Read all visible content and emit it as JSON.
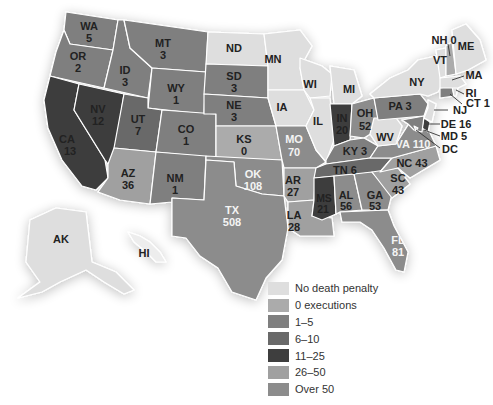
{
  "map": {
    "subject": "Executions by state",
    "states": [
      {
        "abbr": "WA",
        "value": "5",
        "category": "1-5"
      },
      {
        "abbr": "OR",
        "value": "2",
        "category": "1-5"
      },
      {
        "abbr": "CA",
        "value": "13",
        "category": "11-25"
      },
      {
        "abbr": "NV",
        "value": "12",
        "category": "11-25"
      },
      {
        "abbr": "ID",
        "value": "3",
        "category": "1-5"
      },
      {
        "abbr": "MT",
        "value": "3",
        "category": "1-5"
      },
      {
        "abbr": "WY",
        "value": "1",
        "category": "1-5"
      },
      {
        "abbr": "UT",
        "value": "7",
        "category": "6-10"
      },
      {
        "abbr": "AZ",
        "value": "36",
        "category": "26-50"
      },
      {
        "abbr": "CO",
        "value": "1",
        "category": "1-5"
      },
      {
        "abbr": "NM",
        "value": "1",
        "category": "1-5"
      },
      {
        "abbr": "ND",
        "value": "",
        "category": "No death penalty"
      },
      {
        "abbr": "SD",
        "value": "3",
        "category": "1-5"
      },
      {
        "abbr": "NE",
        "value": "3",
        "category": "1-5"
      },
      {
        "abbr": "KS",
        "value": "0",
        "category": "0 executions"
      },
      {
        "abbr": "OK",
        "value": "108",
        "category": "Over 50"
      },
      {
        "abbr": "TX",
        "value": "508",
        "category": "Over 50"
      },
      {
        "abbr": "MN",
        "value": "",
        "category": "No death penalty"
      },
      {
        "abbr": "IA",
        "value": "",
        "category": "No death penalty"
      },
      {
        "abbr": "MO",
        "value": "70",
        "category": "Over 50"
      },
      {
        "abbr": "AR",
        "value": "27",
        "category": "26-50"
      },
      {
        "abbr": "LA",
        "value": "28",
        "category": "26-50"
      },
      {
        "abbr": "WI",
        "value": "",
        "category": "No death penalty"
      },
      {
        "abbr": "IL",
        "value": "",
        "category": "No death penalty"
      },
      {
        "abbr": "MI",
        "value": "",
        "category": "No death penalty"
      },
      {
        "abbr": "IN",
        "value": "20",
        "category": "11-25"
      },
      {
        "abbr": "OH",
        "value": "52",
        "category": "Over 50"
      },
      {
        "abbr": "KY",
        "value": "3",
        "category": "1-5"
      },
      {
        "abbr": "TN",
        "value": "6",
        "category": "6-10"
      },
      {
        "abbr": "MS",
        "value": "21",
        "category": "11-25"
      },
      {
        "abbr": "AL",
        "value": "56",
        "category": "Over 50"
      },
      {
        "abbr": "GA",
        "value": "53",
        "category": "Over 50"
      },
      {
        "abbr": "FL",
        "value": "81",
        "category": "Over 50"
      },
      {
        "abbr": "SC",
        "value": "43",
        "category": "26-50"
      },
      {
        "abbr": "NC",
        "value": "43",
        "category": "26-50"
      },
      {
        "abbr": "VA",
        "value": "110",
        "category": "Over 50"
      },
      {
        "abbr": "WV",
        "value": "",
        "category": "No death penalty"
      },
      {
        "abbr": "PA",
        "value": "3",
        "category": "1-5"
      },
      {
        "abbr": "NY",
        "value": "",
        "category": "No death penalty"
      },
      {
        "abbr": "NJ",
        "value": "",
        "category": "No death penalty"
      },
      {
        "abbr": "DE",
        "value": "16",
        "category": "11-25"
      },
      {
        "abbr": "MD",
        "value": "5",
        "category": "1-5"
      },
      {
        "abbr": "DC",
        "value": "",
        "category": "No death penalty"
      },
      {
        "abbr": "CT",
        "value": "1",
        "category": "1-5"
      },
      {
        "abbr": "RI",
        "value": "",
        "category": "No death penalty"
      },
      {
        "abbr": "MA",
        "value": "",
        "category": "No death penalty"
      },
      {
        "abbr": "VT",
        "value": "",
        "category": "No death penalty"
      },
      {
        "abbr": "NH",
        "value": "0",
        "category": "0 executions"
      },
      {
        "abbr": "ME",
        "value": "",
        "category": "No death penalty"
      },
      {
        "abbr": "AK",
        "value": "",
        "category": "No death penalty"
      },
      {
        "abbr": "HI",
        "value": "",
        "category": "No death penalty"
      }
    ],
    "labels": {
      "WA": "WA",
      "WA_v": "5",
      "OR": "OR",
      "OR_v": "2",
      "CA": "CA",
      "CA_v": "13",
      "NV": "NV",
      "NV_v": "12",
      "ID": "ID",
      "ID_v": "3",
      "MT": "MT",
      "MT_v": "3",
      "WY": "WY",
      "WY_v": "1",
      "UT": "UT",
      "UT_v": "7",
      "AZ": "AZ",
      "AZ_v": "36",
      "CO": "CO",
      "CO_v": "1",
      "NM": "NM",
      "NM_v": "1",
      "ND": "ND",
      "SD": "SD",
      "SD_v": "3",
      "NE": "NE",
      "NE_v": "3",
      "KS": "KS",
      "KS_v": "0",
      "OK": "OK",
      "OK_v": "108",
      "TX": "TX",
      "TX_v": "508",
      "MN": "MN",
      "IA": "IA",
      "MO": "MO",
      "MO_v": "70",
      "AR": "AR",
      "AR_v": "27",
      "LA": "LA",
      "LA_v": "28",
      "WI": "WI",
      "IL": "IL",
      "MI": "MI",
      "IN": "IN",
      "IN_v": "20",
      "OH": "OH",
      "OH_v": "52",
      "KY": "KY 3",
      "TN": "TN 6",
      "MS": "MS",
      "MS_v": "21",
      "AL": "AL",
      "AL_v": "56",
      "GA": "GA",
      "GA_v": "53",
      "FL": "FL",
      "FL_v": "81",
      "SC": "SC",
      "SC_v": "43",
      "NC": "NC 43",
      "VA": "VA 110",
      "WV": "WV",
      "PA": "PA  3",
      "NY": "NY",
      "NJ": "NJ",
      "DE": "DE 16",
      "MD": "MD 5",
      "DC": "DC",
      "CT": "CT 1",
      "RI": "RI",
      "MA": "MA",
      "VT": "VT",
      "NH": "NH 0",
      "ME": "ME",
      "AK": "AK",
      "HI": "HI"
    }
  },
  "legend": {
    "items": [
      {
        "label": "No death penalty",
        "color": "#dedede"
      },
      {
        "label": "0 executions",
        "color": "#ababab"
      },
      {
        "label": "1–5",
        "color": "#7f7f7f"
      },
      {
        "label": "6–10",
        "color": "#696969"
      },
      {
        "label": "11–25",
        "color": "#3e3e3e"
      },
      {
        "label": "26–50",
        "color": "#a0a0a0"
      },
      {
        "label": "Over 50",
        "color": "#8c8c8c"
      }
    ]
  },
  "colors": {
    "none": "#dedede",
    "zero": "#ababab",
    "c1_5": "#7f7f7f",
    "c6_10": "#696969",
    "c11_25": "#3e3e3e",
    "c26_50": "#a0a0a0",
    "over50": "#8c8c8c"
  }
}
